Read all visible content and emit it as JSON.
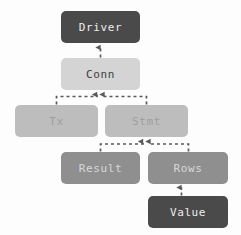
{
  "diagram": {
    "background_color": "#fdfdfd",
    "nodes": [
      {
        "id": "driver",
        "label": "Driver",
        "x": 61,
        "y": 11,
        "w": 79,
        "h": 32,
        "fill": "#4a4a4a",
        "text_color": "#ededed"
      },
      {
        "id": "conn",
        "label": "Conn",
        "x": 61,
        "y": 58,
        "w": 79,
        "h": 32,
        "fill": "#d4d4d4",
        "text_color": "#3c3c3c"
      },
      {
        "id": "tx",
        "label": "Tx",
        "x": 15,
        "y": 105,
        "w": 83,
        "h": 32,
        "fill": "#bdbdbd",
        "text_color": "#9e9e9e"
      },
      {
        "id": "stmt",
        "label": "Stmt",
        "x": 105,
        "y": 105,
        "w": 83,
        "h": 32,
        "fill": "#bdbdbd",
        "text_color": "#9e9e9e"
      },
      {
        "id": "result",
        "label": "Result",
        "x": 61,
        "y": 152,
        "w": 79,
        "h": 32,
        "fill": "#8f8f8f",
        "text_color": "#d8d8d8"
      },
      {
        "id": "rows",
        "label": "Rows",
        "x": 148,
        "y": 152,
        "w": 80,
        "h": 32,
        "fill": "#8f8f8f",
        "text_color": "#d8d8d8"
      },
      {
        "id": "value",
        "label": "Value",
        "x": 148,
        "y": 196,
        "w": 80,
        "h": 32,
        "fill": "#4a4a4a",
        "text_color": "#ededed"
      }
    ],
    "edges": [
      {
        "id": "conn-to-driver",
        "from": "conn",
        "to": "driver",
        "style": "dashed",
        "color": "#5a5a5a",
        "arrow": "up"
      },
      {
        "id": "tx-to-conn",
        "from": "tx",
        "to": "conn",
        "style": "dashed",
        "color": "#5a5a5a",
        "arrow": "up"
      },
      {
        "id": "stmt-to-conn",
        "from": "stmt",
        "to": "conn",
        "style": "dashed",
        "color": "#5a5a5a",
        "arrow": "up"
      },
      {
        "id": "result-to-stmt",
        "from": "result",
        "to": "stmt",
        "style": "dashed",
        "color": "#5a5a5a",
        "arrow": "up"
      },
      {
        "id": "rows-to-stmt",
        "from": "rows",
        "to": "stmt",
        "style": "dashed",
        "color": "#5a5a5a",
        "arrow": "up"
      },
      {
        "id": "value-to-rows",
        "from": "value",
        "to": "rows",
        "style": "dashed",
        "color": "#5a5a5a",
        "arrow": "up"
      }
    ]
  }
}
